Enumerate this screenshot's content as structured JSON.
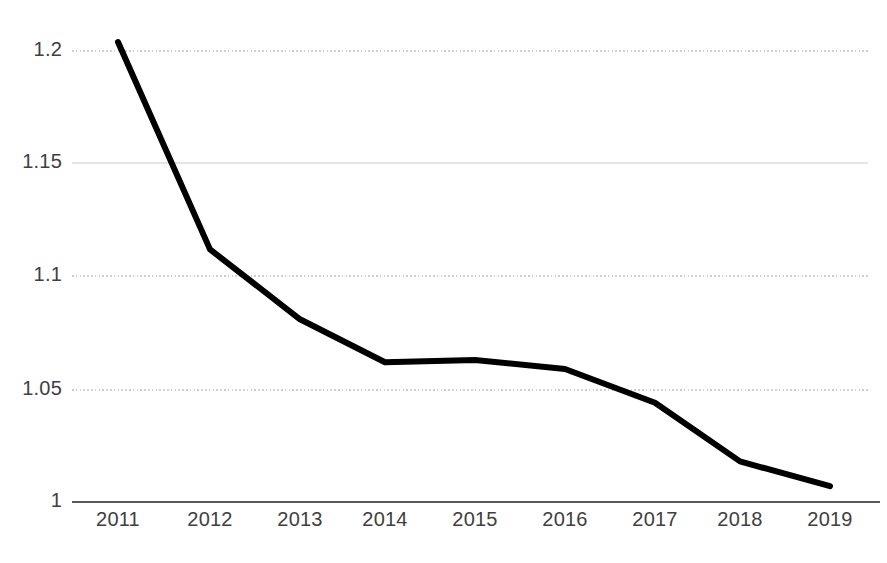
{
  "chart_data": {
    "type": "line",
    "title": "",
    "subtitle": "",
    "xlabel": "",
    "ylabel": "",
    "categories": [
      "2011",
      "2012",
      "2013",
      "2014",
      "2015",
      "2016",
      "2017",
      "2018",
      "2019"
    ],
    "values": [
      1.204,
      1.112,
      1.081,
      1.062,
      1.063,
      1.059,
      1.044,
      1.018,
      1.007
    ],
    "series": [
      {
        "name": "",
        "values": [
          1.204,
          1.112,
          1.081,
          1.062,
          1.063,
          1.059,
          1.044,
          1.018,
          1.007
        ],
        "color": "#000000",
        "line_width": 6
      }
    ],
    "ylim": [
      1.0,
      1.2
    ],
    "xlim": [
      "2011",
      "2019"
    ],
    "yticks": [
      1,
      1.05,
      1.1,
      1.15,
      1.2
    ],
    "ytick_labels": [
      "1",
      "1.05",
      "1.1",
      "1.15",
      "1.2"
    ],
    "xtick_labels": [
      "2011",
      "2012",
      "2013",
      "2014",
      "2015",
      "2016",
      "2017",
      "2018",
      "2019"
    ],
    "grid": true,
    "grid_style": "dotted",
    "grid_color": "#d9d9d9",
    "axis_color": "#595959",
    "legend": false,
    "legend_position": "none",
    "markers": false,
    "annotations": []
  },
  "axes": {
    "y_ticks": [
      {
        "label": "1.2",
        "value": 1.2,
        "y": 51,
        "grid": "dotted"
      },
      {
        "label": "1.15",
        "value": 1.15,
        "y": 163,
        "grid": "solid"
      },
      {
        "label": "1.1",
        "value": 1.1,
        "y": 276,
        "grid": "dotted"
      },
      {
        "label": "1.05",
        "value": 1.05,
        "y": 390,
        "grid": "dotted"
      },
      {
        "label": "1",
        "value": 1.0,
        "y": 502,
        "grid": "axis"
      }
    ],
    "x_ticks": [
      {
        "label": "2011",
        "x": 118
      },
      {
        "label": "2012",
        "x": 210
      },
      {
        "label": "2013",
        "x": 300
      },
      {
        "label": "2014",
        "x": 385
      },
      {
        "label": "2015",
        "x": 475
      },
      {
        "label": "2016",
        "x": 565
      },
      {
        "label": "2017",
        "x": 655
      },
      {
        "label": "2018",
        "x": 740
      },
      {
        "label": "2019",
        "x": 830
      }
    ]
  },
  "colors": {
    "series_line": "#000000",
    "grid_dotted": "#d0d0d0",
    "grid_solid": "#e6e6e6",
    "axis": "#5a5a5a",
    "tick_text": "#404040",
    "background": "#ffffff"
  }
}
